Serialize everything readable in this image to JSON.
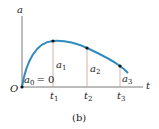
{
  "figure": {
    "caption": "(b)",
    "y_axis_label": "a",
    "x_axis_label": "t",
    "origin_label": "O",
    "initial_label": "a",
    "initial_sub": "0",
    "initial_eq": "= 0",
    "tick_labels": [
      {
        "main": "t",
        "sub": "1"
      },
      {
        "main": "t",
        "sub": "2"
      },
      {
        "main": "t",
        "sub": "3"
      }
    ],
    "point_labels": [
      {
        "main": "a",
        "sub": "1"
      },
      {
        "main": "a",
        "sub": "2"
      },
      {
        "main": "a",
        "sub": "3"
      }
    ],
    "colors": {
      "curve": "#2e8bc0",
      "axis": "#555555",
      "dropline": "#c9a0a0",
      "point": "#111111"
    }
  }
}
